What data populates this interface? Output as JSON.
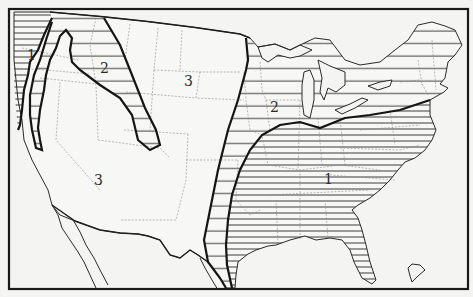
{
  "map": {
    "subject": "United States zone map",
    "zones": [
      {
        "id": "zone-1",
        "label": "1",
        "pattern": "dense horizontal hatching",
        "regions": [
          "Pacific Northwest coast",
          "Southeast United States"
        ]
      },
      {
        "id": "zone-2",
        "label": "2",
        "pattern": "sparse horizontal hatching",
        "regions": [
          "Northern Rockies / Great Basin corridor",
          "Great Plains eastern edge to Texas coast",
          "Midwest and Northeast"
        ]
      },
      {
        "id": "zone-3",
        "label": "3",
        "pattern": "unhatched",
        "regions": [
          "Northern Great Plains",
          "Southwest"
        ]
      }
    ],
    "labels": {
      "nw_coast": "1",
      "great_basin": "2",
      "northern_plains": "3",
      "southwest": "3",
      "midwest": "2",
      "southeast": "1"
    }
  }
}
